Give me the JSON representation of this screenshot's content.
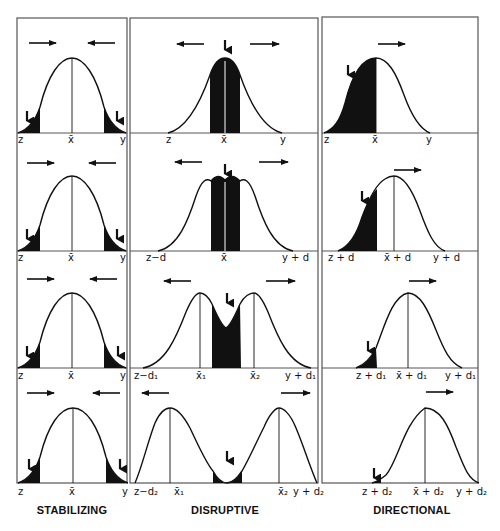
{
  "columns": [
    {
      "title": "STABILIZING",
      "rows": [
        {
          "labels": {
            "left": "z",
            "mean": "x̄",
            "right": "y"
          }
        },
        {
          "labels": {
            "left": "z",
            "mean": "x̄",
            "right": "y"
          }
        },
        {
          "labels": {
            "left": "z",
            "mean": "x̄",
            "right": "y"
          }
        },
        {
          "labels": {
            "left": "z",
            "mean": "x̄",
            "right": "y"
          }
        }
      ]
    },
    {
      "title": "DISRUPTIVE",
      "rows": [
        {
          "labels": {
            "left": "z",
            "mean": "x̄",
            "right": "y"
          }
        },
        {
          "labels": {
            "left": "z−d",
            "mean": "x̄",
            "right": "y + d"
          }
        },
        {
          "labels": {
            "left": "z−d₁",
            "mean1": "x̄₁",
            "mean2": "x̄₂",
            "right": "y + d₁"
          }
        },
        {
          "labels": {
            "left": "z−d₂",
            "mean1": "x̄₁",
            "mean2": "x̄₂",
            "right": "y + d₂"
          }
        }
      ]
    },
    {
      "title": "DIRECTIONAL",
      "rows": [
        {
          "labels": {
            "left": "z",
            "mean": "x̄",
            "right": "y"
          }
        },
        {
          "labels": {
            "left": "z + d",
            "mean": "x̄ + d",
            "right": "y + d"
          }
        },
        {
          "labels": {
            "left": "z + d₁",
            "mean": "x̄ + d₁",
            "right": "y + d₁"
          }
        },
        {
          "labels": {
            "left": "z + d₂",
            "mean": "x̄ + d₂",
            "right": "y + d₂"
          }
        }
      ]
    }
  ],
  "colors": {
    "ink": "#111111",
    "background": "#ffffff",
    "border": "#555555"
  }
}
